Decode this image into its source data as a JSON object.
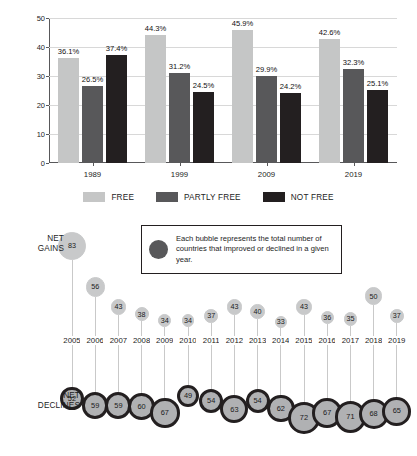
{
  "chart_data": [
    {
      "type": "bar",
      "title": "",
      "xlabel": "",
      "ylabel": "Percentage of Countries",
      "categories": [
        "1989",
        "1999",
        "2009",
        "2019"
      ],
      "ylim": [
        0,
        50
      ],
      "yticks": [
        0,
        10,
        20,
        30,
        40,
        50
      ],
      "grid": true,
      "legend_position": "bottom",
      "series": [
        {
          "name": "FREE",
          "color": "#c5c6c6",
          "values": [
            36.1,
            44.3,
            45.9,
            42.6
          ],
          "labels": [
            "36.1%",
            "44.3%",
            "45.9%",
            "42.6%"
          ]
        },
        {
          "name": "PARTLY FREE",
          "color": "#58585a",
          "values": [
            26.5,
            31.2,
            29.9,
            32.3
          ],
          "labels": [
            "26.5%",
            "31.2%",
            "29.9%",
            "32.3%"
          ]
        },
        {
          "name": "NOT FREE",
          "color": "#231f20",
          "values": [
            37.4,
            24.5,
            24.2,
            25.1
          ],
          "labels": [
            "37.4%",
            "24.5%",
            "24.2%",
            "25.1%"
          ]
        }
      ]
    },
    {
      "type": "scatter",
      "title": "",
      "note": "Each bubble represents the total number of countries that improved or declined in a given year.",
      "xlabel": "",
      "ylabel": "",
      "row_labels": {
        "top": "NET GAINS",
        "bottom": "NET DECLINES"
      },
      "x": [
        "2005",
        "2006",
        "2007",
        "2008",
        "2009",
        "2010",
        "2011",
        "2012",
        "2013",
        "2014",
        "2015",
        "2016",
        "2017",
        "2018",
        "2019"
      ],
      "series": [
        {
          "name": "NET GAINS",
          "color": "#c8c9ca",
          "values": [
            83,
            56,
            43,
            38,
            34,
            34,
            37,
            43,
            40,
            33,
            43,
            36,
            35,
            50,
            37
          ]
        },
        {
          "name": "NET DECLINES",
          "color": "#b0b1b3",
          "values": [
            52,
            59,
            59,
            60,
            67,
            49,
            54,
            63,
            54,
            62,
            72,
            67,
            71,
            68,
            65
          ]
        }
      ]
    }
  ],
  "bar_chart": {
    "y_axis_label": "Percentage of Countries",
    "y_ticks": [
      "0",
      "10",
      "20",
      "30",
      "40",
      "50"
    ],
    "x_ticks": [
      "1989",
      "1999",
      "2009",
      "2019"
    ],
    "legend": [
      {
        "label": "FREE",
        "color": "#c5c6c6"
      },
      {
        "label": "PARTLY FREE",
        "color": "#58585a"
      },
      {
        "label": "NOT FREE",
        "color": "#231f20"
      }
    ],
    "bar_labels": [
      [
        "36.1%",
        "26.5%",
        "37.4%"
      ],
      [
        "44.3%",
        "31.2%",
        "24.5%"
      ],
      [
        "45.9%",
        "29.9%",
        "24.2%"
      ],
      [
        "42.6%",
        "32.3%",
        "25.1%"
      ]
    ]
  },
  "bubble_chart": {
    "net_gains_label_line1": "NET",
    "net_gains_label_line2": "GAINS",
    "net_declines_label_line1": "NET",
    "net_declines_label_line2": "DECLINES",
    "legend_text": "Each bubble represents the total number of countries that improved or declined in a given year.",
    "legend_dot_color": "#58585a",
    "years": [
      "2005",
      "2006",
      "2007",
      "2008",
      "2009",
      "2010",
      "2011",
      "2012",
      "2013",
      "2014",
      "2015",
      "2016",
      "2017",
      "2018",
      "2019"
    ],
    "gains": [
      "83",
      "56",
      "43",
      "38",
      "34",
      "34",
      "37",
      "43",
      "40",
      "33",
      "43",
      "36",
      "35",
      "50",
      "37"
    ],
    "declines": [
      "52",
      "59",
      "59",
      "60",
      "67",
      "49",
      "54",
      "63",
      "54",
      "62",
      "72",
      "67",
      "71",
      "68",
      "65"
    ]
  }
}
